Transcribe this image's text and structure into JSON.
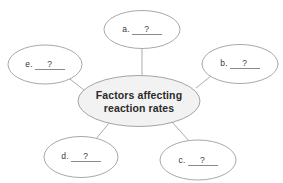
{
  "diagram": {
    "type": "concept-map",
    "background_color": "#ffffff",
    "center": {
      "title_line_1": "Factors affecting",
      "title_line_2": "reaction rates",
      "fill_color": "#f2f2f2",
      "stroke_color": "#9a9a9a",
      "text_color": "#2b2b2b"
    },
    "blank_answer": "?",
    "node_fill_color": "#ffffff",
    "node_stroke_color": "#9e9e9e",
    "connector_color": "#9e9e9e",
    "nodes": [
      {
        "id": "a",
        "letter": "a.",
        "value": "?",
        "position": "top"
      },
      {
        "id": "b",
        "letter": "b.",
        "value": "?",
        "position": "right"
      },
      {
        "id": "c",
        "letter": "c.",
        "value": "?",
        "position": "bottom-right"
      },
      {
        "id": "d",
        "letter": "d.",
        "value": "?",
        "position": "bottom-left"
      },
      {
        "id": "e",
        "letter": "e.",
        "value": "?",
        "position": "left"
      }
    ]
  }
}
